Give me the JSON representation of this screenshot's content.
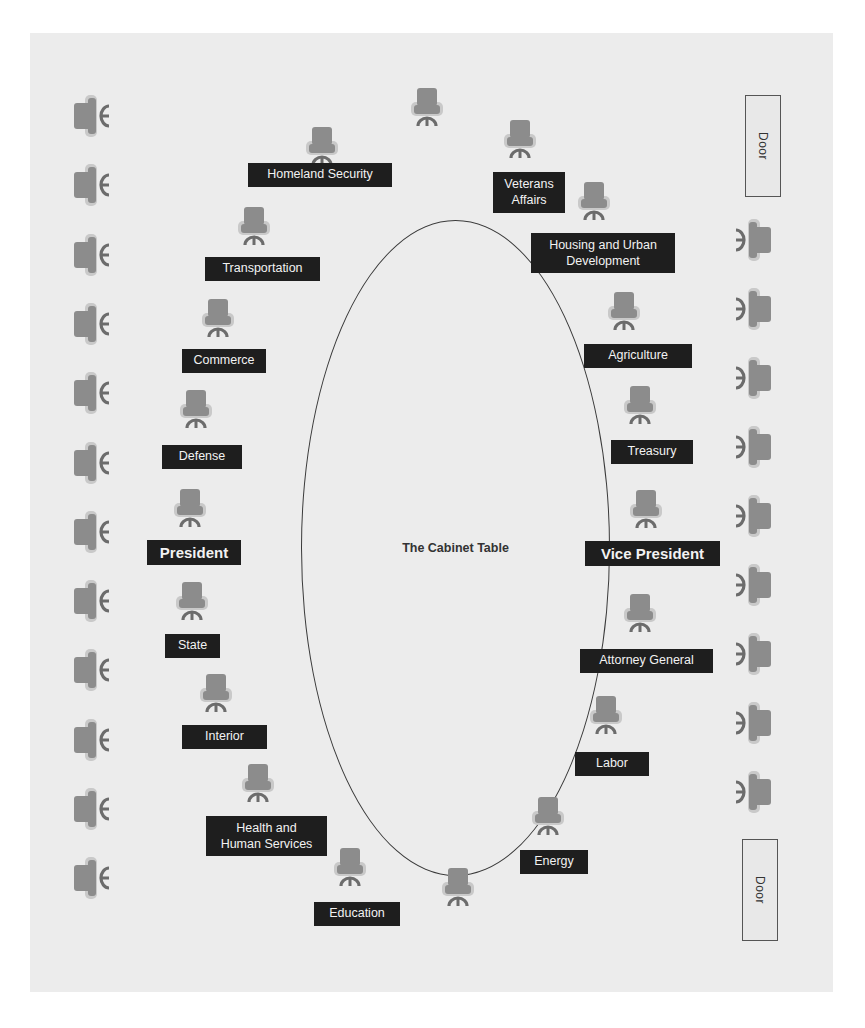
{
  "table": {
    "label": "The Cabinet Table"
  },
  "doors": [
    {
      "label": "Door"
    },
    {
      "label": "Door"
    }
  ],
  "colors": {
    "chair_back": "#8c8c8c",
    "chair_arm": "#c9c9c9",
    "chair_base": "#6c6c6c",
    "label_bg": "#1e1e1e",
    "label_text": "#f2f2f2",
    "room_bg": "#ececec"
  },
  "cabinet_seats": [
    {
      "id": "homeland-security",
      "label": "Homeland Security",
      "side": "left"
    },
    {
      "id": "transportation",
      "label": "Transportation",
      "side": "left"
    },
    {
      "id": "commerce",
      "label": "Commerce",
      "side": "left"
    },
    {
      "id": "defense",
      "label": "Defense",
      "side": "left"
    },
    {
      "id": "president",
      "label": "President",
      "side": "left",
      "emphasis": true
    },
    {
      "id": "state",
      "label": "State",
      "side": "left"
    },
    {
      "id": "interior",
      "label": "Interior",
      "side": "left"
    },
    {
      "id": "health-human-services",
      "label": "Health and Human Services",
      "lines": [
        "Health and",
        "Human Services"
      ],
      "side": "left"
    },
    {
      "id": "education",
      "label": "Education",
      "side": "left"
    },
    {
      "id": "veterans-affairs",
      "label": "Veterans Affairs",
      "lines": [
        "Veterans",
        "Affairs"
      ],
      "side": "right"
    },
    {
      "id": "housing-urban-development",
      "label": "Housing and Urban Development",
      "lines": [
        "Housing and Urban",
        "Development"
      ],
      "side": "right"
    },
    {
      "id": "agriculture",
      "label": "Agriculture",
      "side": "right"
    },
    {
      "id": "treasury",
      "label": "Treasury",
      "side": "right"
    },
    {
      "id": "vice-president",
      "label": "Vice President",
      "side": "right",
      "emphasis": true
    },
    {
      "id": "attorney-general",
      "label": "Attorney General",
      "side": "right"
    },
    {
      "id": "labor",
      "label": "Labor",
      "side": "right"
    },
    {
      "id": "energy",
      "label": "Energy",
      "side": "right"
    }
  ],
  "unlabeled_table_seats": [
    {
      "id": "top-end"
    },
    {
      "id": "bottom-end"
    }
  ],
  "wall_chairs": {
    "left_count": 12,
    "right_count": 9
  }
}
